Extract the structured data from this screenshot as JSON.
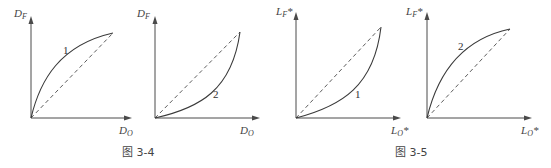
{
  "figures": [
    {
      "caption": "图 3-4",
      "panels": [
        {
          "y_label_main": "D",
          "y_label_sub": "F",
          "y_label_suffix": "",
          "x_label_main": "D",
          "x_label_sub": "O",
          "x_label_suffix": "",
          "curve_label": "1",
          "curve_shape": "concave (above diagonal)",
          "reference_line": "dashed diagonal"
        },
        {
          "y_label_main": "D",
          "y_label_sub": "F",
          "y_label_suffix": "",
          "x_label_main": "D",
          "x_label_sub": "O",
          "x_label_suffix": "",
          "curve_label": "2",
          "curve_shape": "convex (below diagonal)",
          "reference_line": "dashed diagonal"
        }
      ]
    },
    {
      "caption": "图 3-5",
      "panels": [
        {
          "y_label_main": "L",
          "y_label_sub": "F",
          "y_label_suffix": "*",
          "x_label_main": "L",
          "x_label_sub": "O",
          "x_label_suffix": "*",
          "curve_label": "1",
          "curve_shape": "convex (below diagonal)",
          "reference_line": "dashed diagonal"
        },
        {
          "y_label_main": "L",
          "y_label_sub": "F",
          "y_label_suffix": "*",
          "x_label_main": "L",
          "x_label_sub": "O",
          "x_label_suffix": "*",
          "curve_label": "2",
          "curve_shape": "concave (above diagonal)",
          "reference_line": "dashed diagonal"
        }
      ]
    }
  ]
}
